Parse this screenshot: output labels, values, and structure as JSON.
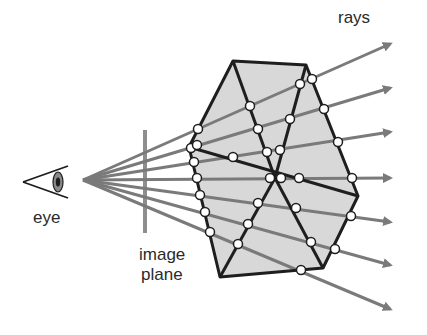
{
  "diagram": {
    "labels": {
      "rays": "rays",
      "eye": "eye",
      "image_plane_line1": "image",
      "image_plane_line2": "plane"
    },
    "colors": {
      "ray": "#7a7a7a",
      "polygon_fill": "#d8d8d8",
      "edge": "#1e1e1e",
      "plane": "#8e8e8e",
      "node_fill": "#ffffff"
    },
    "eye_origin": [
      83,
      180
    ],
    "ray_ends": [
      [
        392,
        87
      ],
      [
        392,
        131
      ],
      [
        392,
        175
      ],
      [
        392,
        219
      ],
      [
        392,
        263
      ],
      [
        392,
        307
      ],
      [
        392,
        307
      ]
    ],
    "node_count": 38
  }
}
